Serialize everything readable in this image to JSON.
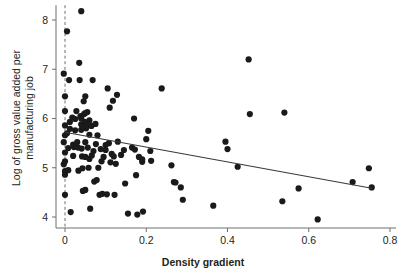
{
  "chart_data": {
    "type": "scatter",
    "title": "",
    "subtitle": "",
    "xlabel": "Density gradient",
    "ylabel": "Log of gross value added per manufacturing job",
    "ylabel_line1": "Log of gross value added per",
    "ylabel_line2": "manufacturing job",
    "xlim": [
      -0.04,
      0.8
    ],
    "ylim": [
      3.78,
      8.35
    ],
    "xticks": [
      0,
      0.2,
      0.4,
      0.6,
      0.8
    ],
    "xtick_labels": [
      "0",
      "0.2",
      "0.4",
      "0.6",
      "0.8"
    ],
    "yticks": [
      4,
      5,
      6,
      7,
      8
    ],
    "ytick_labels": [
      "4",
      "5",
      "6",
      "7",
      "8"
    ],
    "grid": false,
    "legend": null,
    "marker_color": "#1a1a1a",
    "marker_size": 3.1,
    "axis_color": "#6d6e71",
    "reference_line": {
      "orientation": "vertical",
      "x": 0,
      "style": "dashed",
      "color": "#6d6e71"
    },
    "fit_line": {
      "label": "linear fit",
      "color": "#3a3a3a",
      "x_start": 0.0,
      "y_start": 5.72,
      "x_end": 0.755,
      "y_end": 4.585,
      "slope": -1.503,
      "intercept": 5.72
    },
    "series": [
      {
        "name": "observations",
        "n": 124,
        "points": [
          [
            -0.003,
            6.91
          ],
          [
            -0.003,
            5.52
          ],
          [
            -0.003,
            5.07
          ],
          [
            0.0,
            6.15
          ],
          [
            0.0,
            6.45
          ],
          [
            0.0,
            5.86
          ],
          [
            0.0,
            5.66
          ],
          [
            0.0,
            5.31
          ],
          [
            0.0,
            5.13
          ],
          [
            0.0,
            4.93
          ],
          [
            0.0,
            4.86
          ],
          [
            0.0,
            4.45
          ],
          [
            0.005,
            7.77
          ],
          [
            0.005,
            5.7
          ],
          [
            0.008,
            5.4
          ],
          [
            0.008,
            4.95
          ],
          [
            0.01,
            6.78
          ],
          [
            0.012,
            5.93
          ],
          [
            0.012,
            5.79
          ],
          [
            0.014,
            4.1
          ],
          [
            0.018,
            6.02
          ],
          [
            0.02,
            5.47
          ],
          [
            0.02,
            5.24
          ],
          [
            0.022,
            5.42
          ],
          [
            0.025,
            5.99
          ],
          [
            0.025,
            5.76
          ],
          [
            0.028,
            6.15
          ],
          [
            0.03,
            5.52
          ],
          [
            0.032,
            5.41
          ],
          [
            0.033,
            4.94
          ],
          [
            0.035,
            7.13
          ],
          [
            0.036,
            6.78
          ],
          [
            0.038,
            6.05
          ],
          [
            0.04,
            8.18
          ],
          [
            0.04,
            6.0
          ],
          [
            0.04,
            5.88
          ],
          [
            0.04,
            5.77
          ],
          [
            0.041,
            5.39
          ],
          [
            0.042,
            5.23
          ],
          [
            0.043,
            4.99
          ],
          [
            0.044,
            4.53
          ],
          [
            0.046,
            6.35
          ],
          [
            0.047,
            6.09
          ],
          [
            0.048,
            5.93
          ],
          [
            0.048,
            5.82
          ],
          [
            0.05,
            6.45
          ],
          [
            0.05,
            6.11
          ],
          [
            0.05,
            5.52
          ],
          [
            0.05,
            5.22
          ],
          [
            0.05,
            4.55
          ],
          [
            0.052,
            5.8
          ],
          [
            0.054,
            5.86
          ],
          [
            0.055,
            6.13
          ],
          [
            0.056,
            5.41
          ],
          [
            0.058,
            5.0
          ],
          [
            0.06,
            5.96
          ],
          [
            0.06,
            5.67
          ],
          [
            0.06,
            5.18
          ],
          [
            0.062,
            4.17
          ],
          [
            0.065,
            5.85
          ],
          [
            0.066,
            5.25
          ],
          [
            0.068,
            6.78
          ],
          [
            0.07,
            5.34
          ],
          [
            0.072,
            4.72
          ],
          [
            0.075,
            5.89
          ],
          [
            0.076,
            5.48
          ],
          [
            0.078,
            4.75
          ],
          [
            0.08,
            5.66
          ],
          [
            0.082,
            5.0
          ],
          [
            0.085,
            4.45
          ],
          [
            0.088,
            5.38
          ],
          [
            0.09,
            5.13
          ],
          [
            0.092,
            4.47
          ],
          [
            0.095,
            5.22
          ],
          [
            0.1,
            5.46
          ],
          [
            0.1,
            5.36
          ],
          [
            0.103,
            4.46
          ],
          [
            0.105,
            6.61
          ],
          [
            0.108,
            5.5
          ],
          [
            0.11,
            6.22
          ],
          [
            0.112,
            5.11
          ],
          [
            0.115,
            5.28
          ],
          [
            0.118,
            6.36
          ],
          [
            0.12,
            5.23
          ],
          [
            0.122,
            4.45
          ],
          [
            0.125,
            5.08
          ],
          [
            0.128,
            6.48
          ],
          [
            0.13,
            5.53
          ],
          [
            0.138,
            5.26
          ],
          [
            0.145,
            5.36
          ],
          [
            0.148,
            4.68
          ],
          [
            0.155,
            4.07
          ],
          [
            0.165,
            5.41
          ],
          [
            0.17,
            6.0
          ],
          [
            0.172,
            5.37
          ],
          [
            0.175,
            4.85
          ],
          [
            0.178,
            4.05
          ],
          [
            0.182,
            5.22
          ],
          [
            0.19,
            5.12
          ],
          [
            0.19,
            5.17
          ],
          [
            0.192,
            4.11
          ],
          [
            0.2,
            5.58
          ],
          [
            0.205,
            5.75
          ],
          [
            0.21,
            5.34
          ],
          [
            0.212,
            5.14
          ],
          [
            0.238,
            6.61
          ],
          [
            0.262,
            5.05
          ],
          [
            0.268,
            4.71
          ],
          [
            0.272,
            4.7
          ],
          [
            0.285,
            4.6
          ],
          [
            0.29,
            4.35
          ],
          [
            0.365,
            4.23
          ],
          [
            0.395,
            5.53
          ],
          [
            0.4,
            5.38
          ],
          [
            0.425,
            5.02
          ],
          [
            0.452,
            7.2
          ],
          [
            0.455,
            6.09
          ],
          [
            0.535,
            4.32
          ],
          [
            0.54,
            6.12
          ],
          [
            0.575,
            4.58
          ],
          [
            0.622,
            3.95
          ],
          [
            0.708,
            4.71
          ],
          [
            0.748,
            4.99
          ],
          [
            0.755,
            4.6
          ]
        ]
      }
    ]
  }
}
